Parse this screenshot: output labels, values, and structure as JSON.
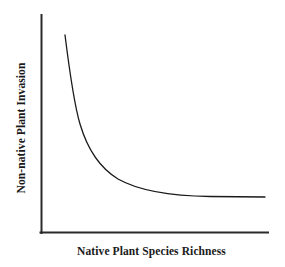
{
  "figure": {
    "background_color": "#ffffff",
    "width": 285,
    "height": 267
  },
  "axes": {
    "line_color": "#2b2b2b",
    "x_label": "Native Plant Species Richness",
    "y_label": "Non-native Plant Invasion"
  },
  "curve": {
    "color": "#1a1a1a",
    "path": "M 65,35 C 70,75 74,104 80,124 C 88,151 100,168 118,179 C 141,192 175,196 210,196.5 C 232,196.8 252,196.9 265,197"
  },
  "chart_data": {
    "type": "line",
    "title": "",
    "subtitle": "",
    "xlabel": "Native Plant Species Richness",
    "ylabel": "Non-native Plant Invasion",
    "xlim": [
      0,
      100
    ],
    "ylim": [
      0,
      100
    ],
    "grid": false,
    "legend": false,
    "xticks": [],
    "yticks": [],
    "xticklabels": [],
    "yticklabels": [],
    "annotations": [],
    "series": [
      {
        "name": "Non-native plant invasion vs native richness",
        "x": [
          11,
          13,
          16,
          19,
          23,
          28,
          34,
          41,
          49,
          58,
          68,
          78,
          88,
          100
        ],
        "y": [
          91,
          78,
          65,
          54,
          44,
          36,
          30,
          25,
          22,
          20,
          19,
          18.5,
          18.2,
          18
        ]
      }
    ]
  }
}
